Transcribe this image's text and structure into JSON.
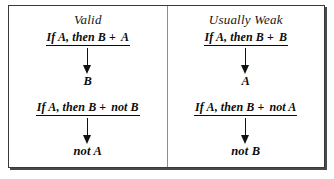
{
  "figure": {
    "type": "logic-argument-forms-table",
    "colors": {
      "background": "#ffffff",
      "border": "#3a3a3a",
      "divider": "#8d8d8d",
      "text": "#0b0b0b",
      "arrow": "#111111"
    }
  },
  "columns": [
    {
      "id": "valid",
      "title": "Valid",
      "arguments": [
        {
          "id": "modus-ponens",
          "premise_conditional": "If A, then B",
          "operator": "+",
          "premise_additional": "A",
          "arrow": "down-arrow",
          "conclusion": "B"
        },
        {
          "id": "modus-tollens",
          "premise_conditional": "If A, then B",
          "operator": "+",
          "premise_additional": "not B",
          "arrow": "down-arrow",
          "conclusion": "not A"
        }
      ]
    },
    {
      "id": "usually-weak",
      "title": "Usually Weak",
      "arguments": [
        {
          "id": "affirming-the-consequent",
          "premise_conditional": "If A, then B",
          "operator": "+",
          "premise_additional": "B",
          "arrow": "down-arrow",
          "conclusion": "A"
        },
        {
          "id": "denying-the-antecedent",
          "premise_conditional": "If A, then B",
          "operator": "+",
          "premise_additional": "not A",
          "arrow": "down-arrow",
          "conclusion": "not B"
        }
      ]
    }
  ]
}
